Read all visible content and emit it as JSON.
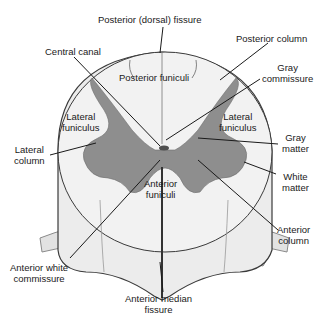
{
  "diagram": {
    "colors": {
      "gray_matter": "#8e8e8e",
      "white_matter": "#ececec",
      "outline": "#3a3a3a",
      "label_text": "#1a1a1a",
      "background": "#ffffff"
    },
    "labels": {
      "posterior_dorsal_fissure": "Posterior (dorsal) fissure",
      "posterior_column": "Posterior column",
      "central_canal": "Central canal",
      "posterior_funiculi": "Posterior funiculi",
      "gray_commissure_1": "Gray",
      "gray_commissure_2": "commissure",
      "lateral_funiculus_left_1": "Lateral",
      "lateral_funiculus_left_2": "funiculus",
      "lateral_funiculus_right_1": "Lateral",
      "lateral_funiculus_right_2": "funiculus",
      "gray_matter_1": "Gray",
      "gray_matter_2": "matter",
      "lateral_column_1": "Lateral",
      "lateral_column_2": "column",
      "white_matter_1": "White",
      "white_matter_2": "matter",
      "anterior_funiculi_1": "Anterior",
      "anterior_funiculi_2": "funiculi",
      "anterior_column_1": "Anterior",
      "anterior_column_2": "column",
      "anterior_white_commissure_1": "Anterior white",
      "anterior_white_commissure_2": "commissure",
      "anterior_median_fissure_1": "Anterior median",
      "anterior_median_fissure_2": "fissure"
    }
  }
}
